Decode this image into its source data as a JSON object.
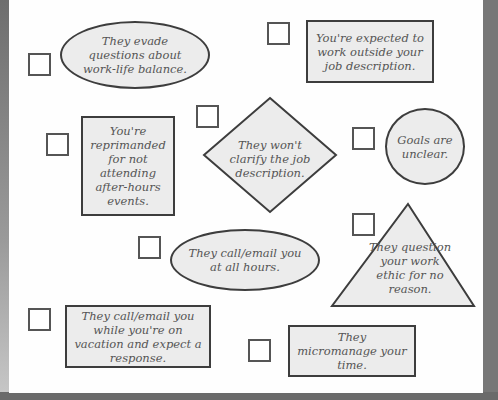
{
  "items": [
    {
      "id": "evade",
      "text": "They evade questions about work-life balance.",
      "shape": "ellipse"
    },
    {
      "id": "outside",
      "text": "You're expected to work outside your job description.",
      "shape": "rectangle"
    },
    {
      "id": "reprimanded",
      "text": "You're reprimanded for not attending after-hours events.",
      "shape": "rectangle"
    },
    {
      "id": "clarify",
      "text": "They won't clarify the job description.",
      "shape": "diamond"
    },
    {
      "id": "goals",
      "text": "Goals are unclear.",
      "shape": "circle"
    },
    {
      "id": "allhours",
      "text": "They call/email you at all hours.",
      "shape": "ellipse"
    },
    {
      "id": "ethic",
      "text": "They question your work ethic for no reason.",
      "shape": "triangle"
    },
    {
      "id": "vacation",
      "text": "They call/email you while you're on vacation and expect a response.",
      "shape": "rectangle"
    },
    {
      "id": "micromanage",
      "text": "They micromanage your time.",
      "shape": "rectangle"
    }
  ],
  "colors": {
    "fill": "#ececec",
    "stroke": "#3d3d3d",
    "text": "#555555"
  }
}
